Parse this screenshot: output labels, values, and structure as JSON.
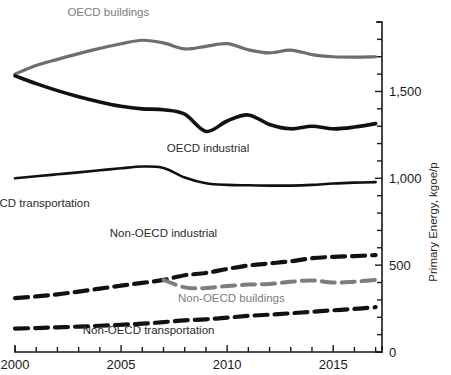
{
  "chart_data": {
    "type": "line",
    "title": "",
    "subtitle": "",
    "xlabel": "",
    "ylabel": "Primary Energy, kgoe/p",
    "xlim": [
      2000,
      2017.3
    ],
    "ylim": [
      0,
      1900
    ],
    "grid": false,
    "legend_position": "inline-annotations",
    "y_axis_side": "right",
    "y_tick_labels": [
      "0",
      "500",
      "1,000",
      "1,500"
    ],
    "y_tick_values": [
      0,
      500,
      1000,
      1500
    ],
    "y_minor_tick_values": [
      100,
      200,
      300,
      400,
      600,
      700,
      800,
      900,
      1100,
      1200,
      1300,
      1400,
      1600,
      1700,
      1800,
      1900
    ],
    "x_tick_labels": [
      "2000",
      "2005",
      "2010",
      "2015"
    ],
    "x_tick_values": [
      2000,
      2005,
      2010,
      2015
    ],
    "x_minor_tick_values": [
      2001,
      2002,
      2003,
      2004,
      2006,
      2007,
      2008,
      2009,
      2011,
      2012,
      2013,
      2014,
      2016,
      2017
    ],
    "x": [
      2000,
      2001,
      2002,
      2003,
      2004,
      2005,
      2006,
      2007,
      2008,
      2009,
      2010,
      2011,
      2012,
      2013,
      2014,
      2015,
      2016,
      2017
    ],
    "series": [
      {
        "name": "OECD buildings",
        "color": "#6e6e6e",
        "style": "solid",
        "width": 3.2,
        "label_x": 2004.4,
        "label_y": 1935,
        "values": [
          1600,
          1650,
          1685,
          1718,
          1748,
          1775,
          1795,
          1780,
          1745,
          1760,
          1775,
          1740,
          1722,
          1738,
          1712,
          1700,
          1698,
          1700
        ]
      },
      {
        "name": "OECD industrial",
        "color": "#111111",
        "style": "solid",
        "width": 3.6,
        "label_x": 2009.1,
        "label_y": 1150,
        "values": [
          1590,
          1545,
          1505,
          1470,
          1440,
          1415,
          1400,
          1395,
          1370,
          1270,
          1330,
          1365,
          1310,
          1285,
          1300,
          1285,
          1295,
          1315
        ]
      },
      {
        "name": "OECD transportation",
        "color": "#111111",
        "style": "solid",
        "width": 2.6,
        "label_x": 2001.0,
        "label_y": 835,
        "values": [
          1000,
          1012,
          1023,
          1034,
          1046,
          1058,
          1068,
          1060,
          1005,
          972,
          962,
          960,
          958,
          958,
          962,
          970,
          975,
          978
        ]
      },
      {
        "name": "Non-OECD industrial",
        "color": "#111111",
        "style": "dashed",
        "width": 4.2,
        "label_x": 2007.0,
        "label_y": 660,
        "values": [
          310,
          320,
          332,
          348,
          365,
          382,
          398,
          415,
          442,
          455,
          478,
          498,
          510,
          522,
          540,
          548,
          552,
          558
        ]
      },
      {
        "name": "Non-OECD buildings",
        "color": "#7d7d7d",
        "style": "dashed",
        "width": 4.0,
        "label_x": 2010.2,
        "label_y": 290,
        "start_index": 7,
        "values": [
          null,
          null,
          null,
          null,
          null,
          null,
          null,
          415,
          372,
          368,
          380,
          388,
          392,
          404,
          412,
          400,
          405,
          415
        ]
      },
      {
        "name": "Non-OECD transportation",
        "color": "#111111",
        "style": "dashed",
        "width": 4.2,
        "label_x": 2006.3,
        "label_y": 105,
        "values": [
          135,
          138,
          142,
          146,
          151,
          157,
          163,
          172,
          182,
          188,
          198,
          208,
          215,
          223,
          232,
          240,
          248,
          258
        ]
      }
    ]
  },
  "axis": {
    "y_title": "Primary Energy, kgoe/p"
  }
}
